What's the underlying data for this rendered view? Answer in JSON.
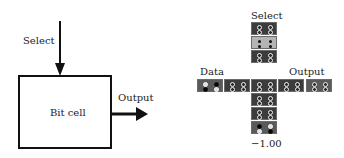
{
  "left_diagram": {
    "select_label": "Select",
    "box_label": "Bit cell",
    "output_label": "Output"
  },
  "right_diagram": {
    "select_label": "Select",
    "data_label": "Data",
    "output_label": "Output",
    "value_label": "−1.00",
    "colors": {
      "dark_cell": "#3c3c3c",
      "light_cell": "#b4b4b4",
      "medium_cell": "#5a5a5a",
      "dot_ring": "#f2f2f2",
      "dot_black": "#050505"
    },
    "column_cells": [
      {
        "shade": "dark",
        "dots": [
          "ring",
          "ring",
          "ring",
          "ring"
        ]
      },
      {
        "shade": "light",
        "dots": [
          "small",
          "small",
          "small",
          "small"
        ]
      },
      {
        "shade": "dark",
        "dots": [
          "ring",
          "ring",
          "ring",
          "ring"
        ]
      },
      {
        "shade": "dark",
        "dots": [
          "ring",
          "ring",
          "ring",
          "ring"
        ]
      },
      {
        "shade": "dark",
        "dots": [
          "ring",
          "ring",
          "ring",
          "ring"
        ]
      },
      {
        "shade": "medium",
        "dots": [
          "black",
          "white",
          "white",
          "black"
        ]
      }
    ],
    "row_cells": [
      {
        "shade": "medium",
        "dots": [
          "white",
          "black",
          "black",
          "white"
        ]
      },
      {
        "shade": "dark",
        "dots": [
          "ring",
          "ring",
          "ring",
          "ring"
        ]
      },
      {
        "shade": "dark",
        "dots": [
          "ring",
          "ring",
          "ring",
          "ring"
        ]
      },
      {
        "shade": "dark",
        "dots": [
          "ring",
          "ring",
          "ring",
          "ring"
        ]
      },
      {
        "shade": "medium",
        "dots": [
          "ring",
          "ring",
          "ring",
          "ring"
        ]
      }
    ]
  }
}
